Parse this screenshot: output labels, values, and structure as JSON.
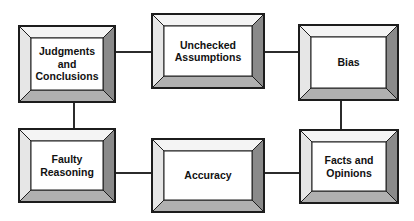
{
  "diagram": {
    "background_color": "#ffffff",
    "line_color": "#2b2b2b",
    "box_face_color": "#ffffff",
    "bevel_top_color": "#f2f2f2",
    "bevel_left_color": "#e4e4e4",
    "bevel_right_color": "#8a8a8a",
    "bevel_bottom_color": "#b0b0b0",
    "outline_color": "#1c1c1c",
    "text_color": "#111111",
    "nodes": [
      {
        "id": "judgments",
        "label": "Judgments\nand\nConclusions"
      },
      {
        "id": "unchecked",
        "label": "Unchecked\nAssumptions"
      },
      {
        "id": "bias",
        "label": "Bias"
      },
      {
        "id": "faulty",
        "label": "Faulty\nReasoning"
      },
      {
        "id": "accuracy",
        "label": "Accuracy"
      },
      {
        "id": "facts",
        "label": "Facts and\nOpinions"
      }
    ],
    "connectors": [
      {
        "id": "judgments-unchecked",
        "orientation": "horizontal"
      },
      {
        "id": "unchecked-bias",
        "orientation": "horizontal"
      },
      {
        "id": "bias-facts",
        "orientation": "vertical"
      },
      {
        "id": "facts-accuracy",
        "orientation": "horizontal"
      },
      {
        "id": "accuracy-faulty",
        "orientation": "horizontal"
      },
      {
        "id": "faulty-judgments",
        "orientation": "vertical"
      }
    ]
  }
}
